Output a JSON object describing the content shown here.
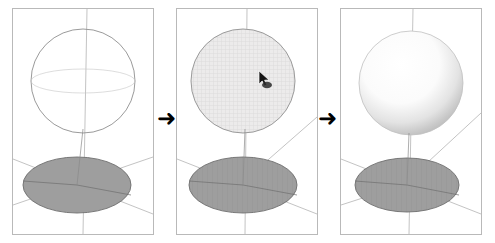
{
  "figure": {
    "title": "",
    "background_color": "#ffffff",
    "panel_border_color": "#b9b9b9",
    "arrow_glyph": "➜",
    "arrow_color": "#000000"
  },
  "panels": [
    {
      "id": "panel-1",
      "name": "wireframe-sphere-panel",
      "caption": "",
      "sphere": {
        "style": "wireframe-outline",
        "fill": "none",
        "stroke": "#8d8d8d",
        "center_x": 70,
        "center_y": 72,
        "radius": 52
      },
      "ground_ellipse": {
        "fill": "#9e9e9e",
        "stroke": "#6f6f6f",
        "center_x": 64,
        "center_y": 176,
        "rx": 54,
        "ry": 28
      },
      "axes_color": "#b0b0b0"
    },
    {
      "id": "panel-2",
      "name": "selected-sphere-panel",
      "caption": "",
      "sphere": {
        "style": "hatched-selected",
        "fill": "#eceaea",
        "stroke": "#9a9a9a",
        "center_x": 66,
        "center_y": 72,
        "radius": 52
      },
      "ground_ellipse": {
        "fill": "#9e9e9e",
        "stroke": "#6f6f6f",
        "center_x": 66,
        "center_y": 176,
        "rx": 54,
        "ry": 28
      },
      "axes_color": "#b0b0b0",
      "cursor": {
        "name": "mouse-cursor",
        "x": 84,
        "y": 70,
        "color": "#1a1a1a"
      }
    },
    {
      "id": "panel-3",
      "name": "shaded-sphere-panel",
      "caption": "",
      "sphere": {
        "style": "shaded-glossy",
        "fill_highlight": "#ffffff",
        "fill_shadow": "#c7c7c7",
        "stroke": "#bdbdbd",
        "center_x": 70,
        "center_y": 74,
        "radius": 52
      },
      "ground_ellipse": {
        "fill": "#9e9e9e",
        "stroke": "#6f6f6f",
        "center_x": 66,
        "center_y": 176,
        "rx": 52,
        "ry": 27
      },
      "axes_color": "#b0b0b0"
    }
  ],
  "arrows": [
    {
      "id": "arrow-1",
      "name": "step-arrow-1",
      "label": "➜"
    },
    {
      "id": "arrow-2",
      "name": "step-arrow-2",
      "label": "➜"
    }
  ]
}
